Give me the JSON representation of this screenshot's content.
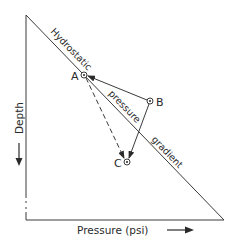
{
  "diagram": {
    "type": "pressure-depth diagram",
    "axes": {
      "x_label": "Pressure (psi)",
      "y_label": "Depth",
      "x_arrow": "arrow-right",
      "y_arrow": "arrow-down"
    },
    "gradient_line": {
      "label_parts": [
        "Hydrostatic",
        "pressure",
        "gradient"
      ]
    },
    "points": [
      {
        "id": "A",
        "label": "A"
      },
      {
        "id": "B",
        "label": "B"
      },
      {
        "id": "C",
        "label": "C"
      }
    ],
    "arrows": [
      {
        "from": "B",
        "to": "A",
        "style": "solid"
      },
      {
        "from": "B",
        "to": "C",
        "style": "solid"
      },
      {
        "from": "A",
        "to": "C",
        "style": "dashed"
      }
    ],
    "colors": {
      "line": "#3a3a3a",
      "text": "#2a2a2a",
      "background": "#ffffff"
    }
  }
}
